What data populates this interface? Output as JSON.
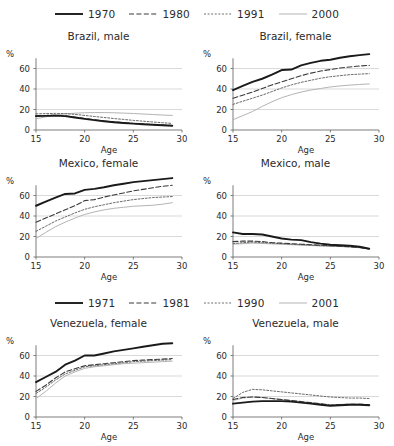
{
  "legends": [
    {
      "name": "legend-top",
      "items": [
        {
          "label": "1970",
          "style": "solid-thick",
          "color": "#1a1a1a"
        },
        {
          "label": "1980",
          "style": "dashed",
          "color": "#3a3a3a"
        },
        {
          "label": "1991",
          "style": "dotted",
          "color": "#6a6a6a"
        },
        {
          "label": "2000",
          "style": "solid-thin",
          "color": "#b4b4b4"
        }
      ]
    },
    {
      "name": "legend-bottom",
      "items": [
        {
          "label": "1971",
          "style": "solid-thick",
          "color": "#1a1a1a"
        },
        {
          "label": "1981",
          "style": "dashed",
          "color": "#3a3a3a"
        },
        {
          "label": "1990",
          "style": "dotted",
          "color": "#6a6a6a"
        },
        {
          "label": "2001",
          "style": "solid-thin",
          "color": "#b4b4b4"
        }
      ]
    }
  ],
  "axes": {
    "pct_symbol": "%",
    "y_ticks": [
      "0",
      "20",
      "40",
      "60"
    ],
    "y_values": [
      0,
      20,
      40,
      60
    ],
    "x_ticks": [
      "15",
      "20",
      "25",
      "30"
    ],
    "x_values": [
      15,
      20,
      25,
      30
    ],
    "x_title": "Age",
    "ylim": [
      0,
      80
    ],
    "xlim": [
      15,
      30
    ],
    "gridlines": [
      20,
      40,
      60
    ]
  },
  "chart_data": [
    {
      "type": "line",
      "title": "Brazil, male",
      "xlabel": "Age",
      "ylabel": "%",
      "xlim": [
        15,
        30
      ],
      "ylim": [
        0,
        80
      ],
      "grid": true,
      "legend": "top",
      "x": [
        15,
        16,
        17,
        18,
        19,
        20,
        21,
        22,
        23,
        24,
        25,
        26,
        27,
        28,
        29
      ],
      "series": [
        {
          "name": "1970",
          "style": "solid-thick",
          "color": "#1a1a1a",
          "values": [
            13.5,
            13.8,
            14.0,
            13.5,
            12.2,
            10.8,
            9.6,
            8.5,
            7.6,
            6.8,
            6.2,
            5.6,
            5.1,
            4.6,
            4.2
          ]
        },
        {
          "name": "1980",
          "style": "dashed",
          "color": "#3a3a3a",
          "values": [
            14.0,
            14.2,
            14.3,
            13.8,
            12.5,
            11.2,
            10.0,
            8.8,
            7.9,
            7.1,
            6.4,
            5.8,
            5.3,
            4.8,
            4.4
          ]
        },
        {
          "name": "1991",
          "style": "dotted",
          "color": "#6a6a6a",
          "values": [
            15.8,
            16.0,
            16.2,
            16.0,
            15.2,
            14.2,
            13.2,
            12.2,
            11.2,
            10.3,
            9.4,
            8.6,
            7.8,
            7.1,
            6.4
          ]
        },
        {
          "name": "2000",
          "style": "solid-thin",
          "color": "#b4b4b4",
          "values": [
            11.0,
            12.8,
            14.6,
            15.8,
            16.4,
            16.8,
            17.0,
            17.0,
            16.8,
            16.5,
            16.1,
            15.6,
            15.1,
            14.6,
            14.2
          ]
        }
      ]
    },
    {
      "type": "line",
      "title": "Brazil, female",
      "xlabel": "Age",
      "ylabel": "%",
      "xlim": [
        15,
        30
      ],
      "ylim": [
        0,
        80
      ],
      "grid": true,
      "legend": "top",
      "x": [
        15,
        16,
        17,
        18,
        19,
        20,
        21,
        22,
        23,
        24,
        25,
        26,
        27,
        28,
        29
      ],
      "series": [
        {
          "name": "1970",
          "style": "solid-thick",
          "color": "#1a1a1a",
          "values": [
            39,
            43,
            47,
            50,
            54,
            58.5,
            59,
            63,
            65.5,
            67.5,
            68.5,
            70.5,
            72,
            73,
            74
          ]
        },
        {
          "name": "1980",
          "style": "dashed",
          "color": "#3a3a3a",
          "values": [
            31,
            34,
            37,
            40.5,
            44,
            47,
            50,
            53,
            55.5,
            57.5,
            59,
            60.5,
            61.5,
            62.5,
            63
          ]
        },
        {
          "name": "1991",
          "style": "dotted",
          "color": "#6a6a6a",
          "values": [
            25,
            28,
            31,
            34,
            37.5,
            41,
            44,
            46.5,
            48.5,
            50.5,
            52,
            53,
            54,
            54.5,
            55
          ]
        },
        {
          "name": "2000",
          "style": "solid-thin",
          "color": "#b4b4b4",
          "values": [
            10,
            14,
            18,
            23,
            27.5,
            31.5,
            34.5,
            37,
            39,
            40.5,
            42,
            43,
            43.8,
            44.4,
            45
          ]
        }
      ]
    },
    {
      "type": "line",
      "title": "Mexico, female",
      "xlabel": "Age",
      "ylabel": "%",
      "xlim": [
        15,
        30
      ],
      "ylim": [
        0,
        80
      ],
      "grid": true,
      "legend": "top",
      "x": [
        15,
        16,
        17,
        18,
        19,
        20,
        21,
        22,
        23,
        24,
        25,
        26,
        27,
        28,
        29
      ],
      "values_note": "solid=1970",
      "series": [
        {
          "name": "1970",
          "style": "solid-thick",
          "color": "#1a1a1a",
          "values": [
            50,
            54,
            58,
            61.5,
            62,
            65.5,
            66.5,
            68,
            70,
            71.5,
            73,
            74,
            75,
            76,
            77
          ]
        },
        {
          "name": "1980",
          "style": "dashed",
          "color": "#3a3a3a",
          "values": [
            34,
            38,
            42,
            46,
            50,
            55,
            56,
            58.5,
            60.5,
            62.5,
            64.5,
            66,
            67.5,
            69,
            70
          ]
        },
        {
          "name": "1991",
          "style": "dotted",
          "color": "#6a6a6a",
          "values": [
            25,
            30,
            35,
            39,
            43,
            46.5,
            49,
            51,
            53,
            54.5,
            56,
            57,
            58,
            58.5,
            59
          ]
        },
        {
          "name": "2000",
          "style": "solid-thin",
          "color": "#b4b4b4",
          "values": [
            18,
            24,
            29.5,
            34,
            38,
            41.5,
            44,
            46,
            47.5,
            48.5,
            49.5,
            50,
            50.5,
            51.5,
            53
          ]
        }
      ]
    },
    {
      "type": "line",
      "title": "Mexico, male",
      "xlabel": "Age",
      "ylabel": "%",
      "xlim": [
        15,
        30
      ],
      "ylim": [
        0,
        80
      ],
      "grid": true,
      "legend": "top",
      "x": [
        15,
        16,
        17,
        18,
        19,
        20,
        21,
        22,
        23,
        24,
        25,
        26,
        27,
        28,
        29
      ],
      "series": [
        {
          "name": "1970",
          "style": "solid-thick",
          "color": "#1a1a1a",
          "values": [
            24,
            22.5,
            22.5,
            22,
            20,
            18,
            17,
            16.5,
            14.5,
            13,
            12,
            11.5,
            11,
            10,
            8
          ]
        },
        {
          "name": "1980",
          "style": "dashed",
          "color": "#3a3a3a",
          "values": [
            15,
            15.5,
            15.5,
            15,
            14,
            13.5,
            13,
            12.5,
            12,
            11.5,
            11,
            10.5,
            10,
            9.2,
            8
          ]
        },
        {
          "name": "1991",
          "style": "dotted",
          "color": "#6a6a6a",
          "values": [
            13,
            14,
            14.5,
            14,
            13.5,
            13,
            12.5,
            12,
            11.5,
            11,
            10.8,
            10.4,
            10,
            9.2,
            8
          ]
        },
        {
          "name": "2000",
          "style": "solid-thin",
          "color": "#b4b4b4",
          "values": [
            12.5,
            13,
            13.5,
            13.2,
            12.8,
            12.4,
            12,
            11.6,
            11.2,
            10.8,
            10.5,
            10.2,
            9.8,
            9,
            7.8
          ]
        }
      ]
    },
    {
      "type": "line",
      "title": "Venezuela, female",
      "xlabel": "Age",
      "ylabel": "%",
      "xlim": [
        15,
        30
      ],
      "ylim": [
        0,
        80
      ],
      "grid": true,
      "legend": "bottom",
      "x": [
        15,
        16,
        17,
        18,
        19,
        20,
        21,
        22,
        23,
        24,
        25,
        26,
        27,
        28,
        29
      ],
      "series": [
        {
          "name": "1971",
          "style": "solid-thick",
          "color": "#1a1a1a",
          "values": [
            34,
            39,
            44,
            51,
            55,
            60,
            60,
            62,
            64,
            65.5,
            67,
            68.5,
            70,
            71.5,
            72
          ]
        },
        {
          "name": "1981",
          "style": "dashed",
          "color": "#3a3a3a",
          "values": [
            25,
            31,
            38,
            44,
            47,
            50,
            51,
            52,
            53,
            54,
            55,
            55.5,
            56,
            56.5,
            57
          ]
        },
        {
          "name": "1990",
          "style": "dotted",
          "color": "#6a6a6a",
          "values": [
            23,
            29,
            36,
            42,
            45.5,
            49,
            50,
            51,
            52,
            53,
            54,
            54.5,
            55,
            55.5,
            56
          ]
        },
        {
          "name": "2001",
          "style": "solid-thin",
          "color": "#b4b4b4",
          "values": [
            18,
            25,
            33,
            40,
            44,
            47.5,
            49,
            50,
            51,
            52,
            52.5,
            53,
            53.5,
            54,
            54.5
          ]
        }
      ]
    },
    {
      "type": "line",
      "title": "Venezuela, male",
      "xlabel": "Age",
      "ylabel": "%",
      "xlim": [
        15,
        30
      ],
      "ylim": [
        0,
        80
      ],
      "grid": true,
      "legend": "bottom",
      "x": [
        15,
        16,
        17,
        18,
        19,
        20,
        21,
        22,
        23,
        24,
        25,
        26,
        27,
        28,
        29
      ],
      "series": [
        {
          "name": "1971",
          "style": "solid-thick",
          "color": "#1a1a1a",
          "values": [
            13,
            14,
            15,
            15.5,
            15.5,
            15.5,
            15,
            14,
            13,
            12,
            11,
            11.5,
            12,
            12,
            11.5
          ]
        },
        {
          "name": "1981",
          "style": "dashed",
          "color": "#3a3a3a",
          "values": [
            17,
            19,
            19.5,
            19,
            18,
            17,
            16,
            15,
            14,
            13,
            11.5,
            12,
            12.5,
            12.5,
            12
          ]
        },
        {
          "name": "1990",
          "style": "dotted",
          "color": "#6a6a6a",
          "values": [
            18,
            24,
            27,
            26.5,
            25.5,
            24.5,
            23.5,
            22.5,
            21.5,
            20.5,
            19.5,
            19,
            18.5,
            18.5,
            18
          ]
        },
        {
          "name": "2001",
          "style": "solid-thin",
          "color": "#b4b4b4",
          "values": [
            16,
            18.5,
            19.5,
            19,
            18,
            17,
            16,
            15,
            14,
            13,
            12,
            12.3,
            12.6,
            12.5,
            12
          ]
        }
      ]
    }
  ]
}
